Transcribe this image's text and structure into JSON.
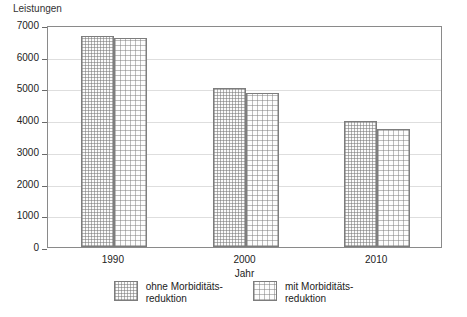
{
  "chart_data": {
    "type": "bar",
    "title": "",
    "ylabel": "Leistungen",
    "xlabel": "Jahr",
    "categories": [
      "1990",
      "2000",
      "2010"
    ],
    "series": [
      {
        "name": "ohne Morbiditäts-\nreduktion",
        "values": [
          6650,
          5000,
          3960
        ]
      },
      {
        "name": "mit Morbiditäts-\nreduktion",
        "values": [
          6580,
          4870,
          3720
        ]
      }
    ],
    "ylim": [
      0,
      7000
    ],
    "yticks": [
      0,
      1000,
      2000,
      3000,
      4000,
      5000,
      6000,
      7000
    ],
    "ytick_labels": [
      "0",
      "1000",
      "2000",
      "3000",
      "4000",
      "5000",
      "6000",
      "7000"
    ],
    "grid": true,
    "legend_position": "bottom"
  },
  "legend": {
    "items": [
      {
        "label": "ohne Morbiditäts-\nreduktion",
        "pattern": "dense-hatch"
      },
      {
        "label": "mit Morbiditäts-\nreduktion",
        "pattern": "sparse-dots"
      }
    ]
  }
}
